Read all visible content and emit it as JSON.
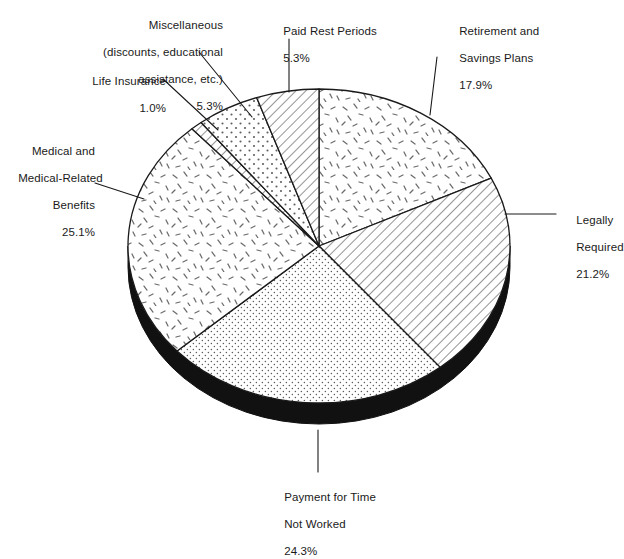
{
  "chart_data": {
    "type": "pie",
    "title": "",
    "subtitle": "",
    "xlabel": "",
    "ylabel": "",
    "legend_position": "none",
    "grid": false,
    "style": "3d-exploded-ellipse-black-base",
    "units": "percent",
    "total": 100.1,
    "categories": [
      "Retirement and Savings Plans",
      "Legally Required",
      "Payment for Time Not Worked",
      "Medical and Medical-Related Benefits",
      "Life Insurance",
      "Miscellaneous (discounts, educational assistance, etc.)",
      "Paid Rest Periods"
    ],
    "values": [
      17.9,
      21.2,
      24.3,
      25.1,
      1.0,
      5.3,
      5.3
    ],
    "slices": [
      {
        "name": "retirement-and-savings-plans",
        "label_lines": [
          "Retirement and",
          "Savings Plans"
        ],
        "value": 17.9,
        "value_text": "17.9%",
        "pattern": "dash-speckle",
        "start_angle_deg": 0.0,
        "end_angle_deg": 64.44
      },
      {
        "name": "legally-required",
        "label_lines": [
          "Legally",
          "Required"
        ],
        "value": 21.2,
        "value_text": "21.2%",
        "pattern": "diagonal-hatch",
        "start_angle_deg": 64.44,
        "end_angle_deg": 140.76
      },
      {
        "name": "payment-for-time-not-worked",
        "label_lines": [
          "Payment for Time",
          "Not Worked"
        ],
        "value": 24.3,
        "value_text": "24.3%",
        "pattern": "fine-dots",
        "start_angle_deg": 140.76,
        "end_angle_deg": 228.24
      },
      {
        "name": "medical-and-medical-related-benefits",
        "label_lines": [
          "Medical and",
          "Medical-Related",
          "Benefits"
        ],
        "value": 25.1,
        "value_text": "25.1%",
        "pattern": "dash-speckle",
        "start_angle_deg": 228.24,
        "end_angle_deg": 318.6
      },
      {
        "name": "life-insurance",
        "label_lines": [
          "Life Insurance"
        ],
        "value": 1.0,
        "value_text": "1.0%",
        "pattern": "diagonal-hatch",
        "start_angle_deg": 318.6,
        "end_angle_deg": 322.2
      },
      {
        "name": "miscellaneous",
        "label_lines": [
          "Miscellaneous",
          "(discounts, educational",
          "assistance, etc.)"
        ],
        "value": 5.3,
        "value_text": "5.3%",
        "pattern": "coarse-dots",
        "start_angle_deg": 322.2,
        "end_angle_deg": 341.28
      },
      {
        "name": "paid-rest-periods",
        "label_lines": [
          "Paid Rest Periods"
        ],
        "value": 5.3,
        "value_text": "5.3%",
        "pattern": "diagonal-hatch",
        "start_angle_deg": 341.28,
        "end_angle_deg": 360.0
      }
    ]
  },
  "labels": {
    "miscellaneous": {
      "line1": "Miscellaneous",
      "line2": "(discounts, educational",
      "line3": "assistance, etc.)",
      "pct": "5.3%"
    },
    "life_insurance": {
      "line1": "Life Insurance",
      "pct": "1.0%"
    },
    "medical": {
      "line1": "Medical and",
      "line2": "Medical-Related",
      "line3": "Benefits",
      "pct": "25.1%"
    },
    "paid_rest_periods": {
      "line1": "Paid Rest Periods",
      "pct": "5.3%"
    },
    "retirement": {
      "line1": "Retirement and",
      "line2": "Savings Plans",
      "pct": "17.9%"
    },
    "legally_required": {
      "line1": "Legally",
      "line2": "Required",
      "pct": "21.2%"
    },
    "payment_time": {
      "line1": "Payment for Time",
      "line2": "Not Worked",
      "pct": "24.3%"
    }
  },
  "colors": {
    "outline": "#1a1a1a",
    "base_3d": "#111111",
    "text": "#1a1a1a",
    "background": "#ffffff",
    "pattern_ink": "#4a4a4a"
  }
}
